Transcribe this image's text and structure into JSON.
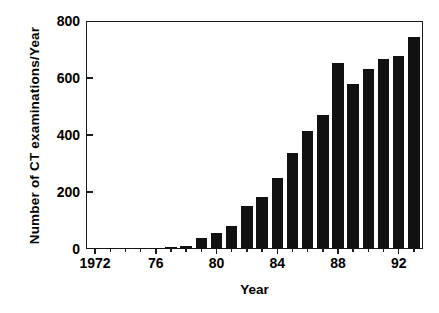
{
  "chart_data": {
    "type": "bar",
    "title": "",
    "xlabel": "Year",
    "ylabel": "Number of CT examinations/Year",
    "categories": [
      1972,
      1973,
      1974,
      1975,
      1976,
      1977,
      1978,
      1979,
      1980,
      1981,
      1982,
      1983,
      1984,
      1985,
      1986,
      1987,
      1988,
      1989,
      1990,
      1991,
      1992,
      1993
    ],
    "values": [
      2,
      3,
      3,
      4,
      5,
      6,
      10,
      40,
      57,
      80,
      152,
      183,
      248,
      337,
      413,
      470,
      652,
      580,
      630,
      667,
      676,
      745
    ],
    "ylim": [
      0,
      800
    ],
    "xlim": [
      1971.4,
      1993.6
    ],
    "yticks": [
      0,
      200,
      400,
      600,
      800
    ],
    "ytick_labels": [
      "0",
      "200",
      "400",
      "600",
      "800"
    ],
    "xticks": [
      1972,
      1976,
      1980,
      1984,
      1988,
      1992
    ],
    "xtick_labels": [
      "1972",
      "76",
      "80",
      "84",
      "88",
      "92"
    ],
    "xtick_minor": [
      1973,
      1974,
      1975,
      1977,
      1978,
      1979,
      1981,
      1982,
      1983,
      1985,
      1986,
      1987,
      1989,
      1990,
      1991,
      1993
    ],
    "grid": false,
    "legend": null,
    "bar_color": "#111111",
    "axis_color": "#1a1a1a",
    "background": "#ffffff"
  }
}
